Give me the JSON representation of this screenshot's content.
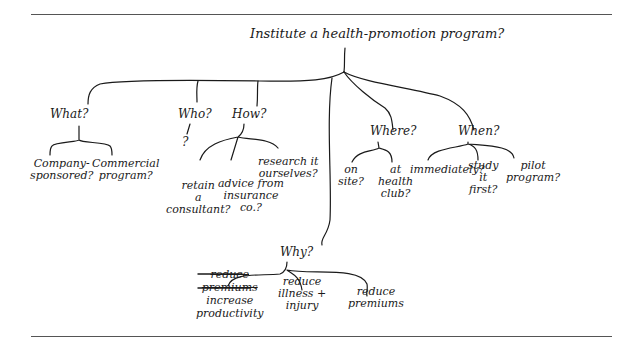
{
  "root": {
    "label": "Institute a health-promotion program?"
  },
  "questions": {
    "what": {
      "label": "What?",
      "children": [
        {
          "line1": "Company-",
          "line2": "sponsored?"
        },
        {
          "line1": "Commercial",
          "line2": "program?"
        }
      ]
    },
    "who": {
      "label": "Who?",
      "child": "?"
    },
    "how": {
      "label": "How?",
      "children": [
        {
          "line1": "retain",
          "line2": "a",
          "line3": "consultant?"
        },
        {
          "line1": "advice from",
          "line2": "insurance",
          "line3": "co.?"
        },
        {
          "line1": "research it",
          "line2": "ourselves?"
        }
      ]
    },
    "why": {
      "label": "Why?",
      "children": [
        {
          "struck1": "reduce",
          "struck2": "premiums",
          "line1": "increase",
          "line2": "productivity"
        },
        {
          "line1": "reduce",
          "line2": "illness +",
          "line3": "injury"
        },
        {
          "line1": "reduce",
          "line2": "premiums"
        }
      ]
    },
    "where": {
      "label": "Where?",
      "children": [
        {
          "line1": "on",
          "line2": "site?"
        },
        {
          "line1": "at",
          "line2": "health",
          "line3": "club?"
        }
      ]
    },
    "when": {
      "label": "When?",
      "children": [
        {
          "line1": "immediately?"
        },
        {
          "line1": "study",
          "line2": "it",
          "line3": "first?"
        },
        {
          "line1": "pilot",
          "line2": "program?"
        }
      ]
    }
  },
  "colors": {
    "ink": "#1a1a1a",
    "rule": "#555555"
  }
}
